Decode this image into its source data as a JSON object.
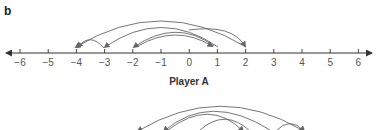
{
  "panel_label": "b",
  "number_line_a": {
    "title": "Player A",
    "ticks": [
      "−6",
      "−5",
      "−4",
      "−3",
      "−2",
      "−1",
      "0",
      "1",
      "2",
      "3",
      "4",
      "5",
      "6"
    ],
    "arcs": [
      {
        "from": 2,
        "to": -4
      },
      {
        "from": -3,
        "to": -4
      },
      {
        "from": 1,
        "to": -3
      },
      {
        "from": 1,
        "to": -2
      },
      {
        "from": -2,
        "to": 1
      },
      {
        "from": -4,
        "to": 2
      }
    ]
  },
  "number_line_b": {
    "arcs_visible_partial": true
  },
  "colors": {
    "line": "#333333",
    "arc": "#666666",
    "text": "#555555"
  }
}
